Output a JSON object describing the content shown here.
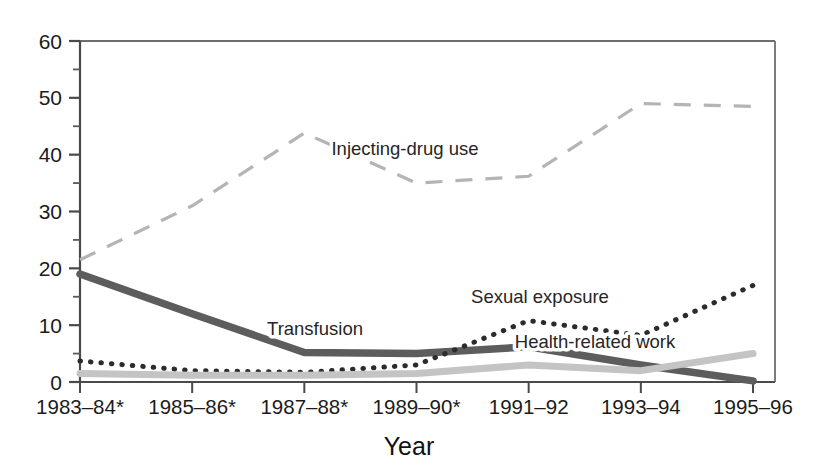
{
  "chart_data": {
    "type": "line",
    "title": "",
    "xlabel": "Year",
    "ylabel": "",
    "categories": [
      "1983–84*",
      "1985–86*",
      "1987–88*",
      "1989–90*",
      "1991–92",
      "1993–94",
      "1995–96"
    ],
    "ylim": [
      0,
      60
    ],
    "ytick_labels": [
      "0",
      "10",
      "20",
      "30",
      "40",
      "50",
      "60"
    ],
    "ytick_values": [
      0,
      10,
      20,
      30,
      40,
      50,
      60
    ],
    "yminor_values": [
      5,
      15,
      25,
      35,
      45,
      55
    ],
    "grid": false,
    "legend": "inline-annotations",
    "series": [
      {
        "name": "Injecting-drug use",
        "style": "dashed",
        "color": "#b4b4b4",
        "width": 3.2,
        "label_x": 405,
        "label_y": 155,
        "values": [
          21.5,
          31.0,
          43.8,
          35.0,
          36.2,
          49.0,
          48.5
        ]
      },
      {
        "name": "Transfusion",
        "style": "solid",
        "color": "#5d5d5d",
        "width": 7.5,
        "label_x": 315,
        "label_y": 335,
        "values": [
          19.0,
          12.0,
          5.2,
          5.0,
          6.2,
          3.0,
          0.2
        ]
      },
      {
        "name": "Sexual exposure",
        "style": "dotted",
        "color": "#2b2b2b",
        "width": 5.0,
        "label_x": 540,
        "label_y": 303,
        "values": [
          3.7,
          2.0,
          1.7,
          3.0,
          10.8,
          8.2,
          17.0
        ]
      },
      {
        "name": "Health-related work",
        "style": "solid",
        "color": "#c4c4c4",
        "width": 7.0,
        "label_x": 595,
        "label_y": 348,
        "values": [
          1.5,
          1.2,
          1.2,
          1.5,
          3.0,
          2.0,
          5.0
        ]
      }
    ]
  },
  "axes": {
    "x_title": "Year"
  }
}
